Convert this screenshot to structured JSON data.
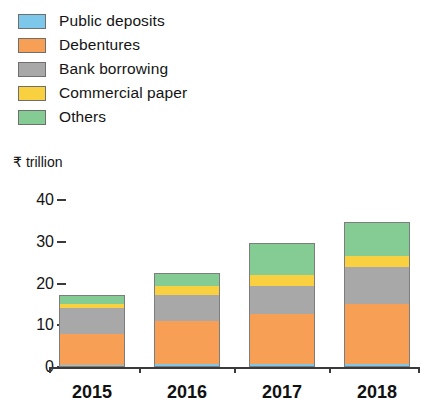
{
  "chart_data": {
    "type": "bar",
    "subtype": "stacked-vertical",
    "title": "",
    "subtitle": "",
    "xlabel": "",
    "ylabel": "₹ trillion",
    "categories": [
      "2015",
      "2016",
      "2017",
      "2018"
    ],
    "ytick_labels": [
      "0",
      "10",
      "20",
      "30",
      "40"
    ],
    "ytick_values": [
      0,
      10,
      20,
      30,
      40
    ],
    "ylim": [
      0,
      40
    ],
    "grid": false,
    "legend_position": "top-left",
    "stack_order_bottom_to_top": [
      "Public deposits",
      "Debentures",
      "Bank borrowing",
      "Commercial paper",
      "Others"
    ],
    "series": [
      {
        "name": "Public deposits",
        "color": "#7DC8EA",
        "values": [
          0.5,
          0.6,
          0.7,
          0.8
        ]
      },
      {
        "name": "Debentures",
        "color": "#F7A055",
        "values": [
          7.4,
          10.5,
          12.1,
          14.3
        ]
      },
      {
        "name": "Bank borrowing",
        "color": "#A8A8A8",
        "values": [
          6.2,
          6.2,
          6.7,
          8.8
        ]
      },
      {
        "name": "Commercial paper",
        "color": "#F9D040",
        "values": [
          1.0,
          2.1,
          2.6,
          2.6
        ]
      },
      {
        "name": "Others",
        "color": "#84CC94",
        "values": [
          2.1,
          3.1,
          7.6,
          8.3
        ]
      }
    ],
    "totals": [
      17.2,
      22.5,
      29.7,
      34.8
    ]
  },
  "legend": {
    "items": [
      {
        "label": "Public deposits",
        "color": "#7DC8EA"
      },
      {
        "label": "Debentures",
        "color": "#F7A055"
      },
      {
        "label": "Bank borrowing",
        "color": "#A8A8A8"
      },
      {
        "label": "Commercial paper",
        "color": "#F9D040"
      },
      {
        "label": "Others",
        "color": "#84CC94"
      }
    ]
  },
  "axis": {
    "unit_caption": "₹ trillion"
  },
  "colors": {
    "axis": "#3a3a3a",
    "text": "#141414",
    "background": "#ffffff",
    "segment_border": "#7d7d7d"
  }
}
